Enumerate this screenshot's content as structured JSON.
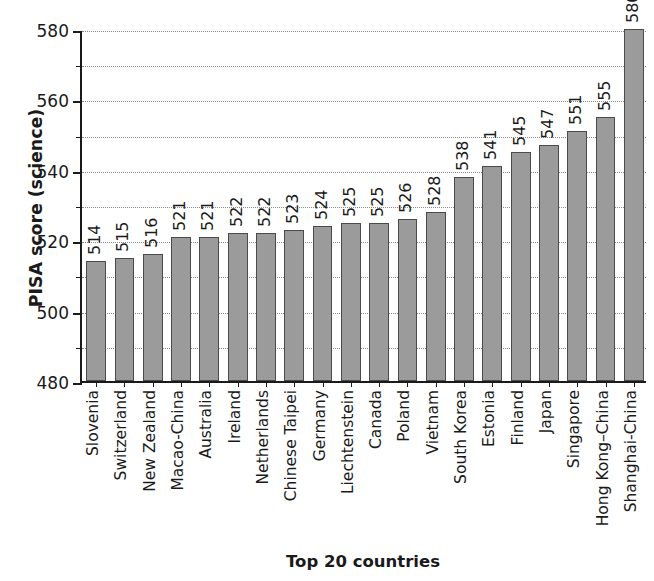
{
  "chart_data": {
    "type": "bar",
    "title": "",
    "xlabel": "Top 20 countries",
    "ylabel": "PISA score (science)",
    "ylim": [
      480,
      580
    ],
    "yticks": [
      480,
      500,
      520,
      540,
      560,
      580
    ],
    "yticks_minor": [
      490,
      510,
      530,
      550,
      570
    ],
    "grid": true,
    "legend": "none",
    "bar_color": "#9b9b9b",
    "bar_edge_color": "#4a4a4a",
    "categories": [
      "Slovenia",
      "Switzerland",
      "New Zealand",
      "Macao-China",
      "Australia",
      "Ireland",
      "Netherlands",
      "Chinese Taipei",
      "Germany",
      "Liechtenstein",
      "Canada",
      "Poland",
      "Vietnam",
      "South Korea",
      "Estonia",
      "Finland",
      "Japan",
      "Singapore",
      "Hong Kong–China",
      "Shanghai-China"
    ],
    "values": [
      514,
      515,
      516,
      521,
      521,
      522,
      522,
      523,
      524,
      525,
      525,
      526,
      528,
      538,
      541,
      545,
      547,
      551,
      555,
      580
    ],
    "value_labels": [
      "514",
      "515",
      "516",
      "521",
      "521",
      "522",
      "522",
      "523",
      "524",
      "525",
      "525",
      "526",
      "528",
      "538",
      "541",
      "545",
      "547",
      "551",
      "555",
      "580"
    ]
  },
  "axis": {
    "y_title": "PISA score (science)",
    "x_title": "Top 20 countries",
    "y_tick_labels": [
      "480",
      "500",
      "520",
      "540",
      "560",
      "580"
    ]
  }
}
